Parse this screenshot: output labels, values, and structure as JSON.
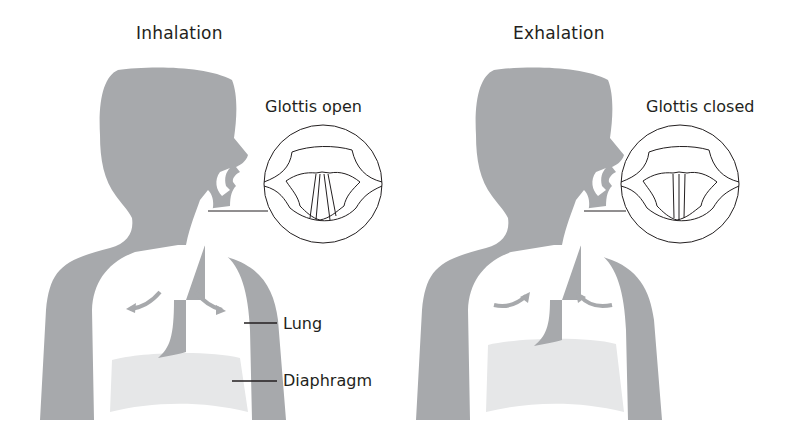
{
  "panels": [
    {
      "title": "Inhalation",
      "glottis_label": "Glottis open",
      "glottis_state": "open",
      "arrow_direction": "outward",
      "callouts": [
        {
          "label": "Lung"
        },
        {
          "label": "Diaphragm"
        }
      ]
    },
    {
      "title": "Exhalation",
      "glottis_label": "Glottis closed",
      "glottis_state": "closed",
      "arrow_direction": "inward"
    }
  ],
  "colors": {
    "body": "#a7a9ac",
    "diaphragm": "#e6e7e8",
    "background": "#ffffff",
    "line": "#231f20"
  }
}
